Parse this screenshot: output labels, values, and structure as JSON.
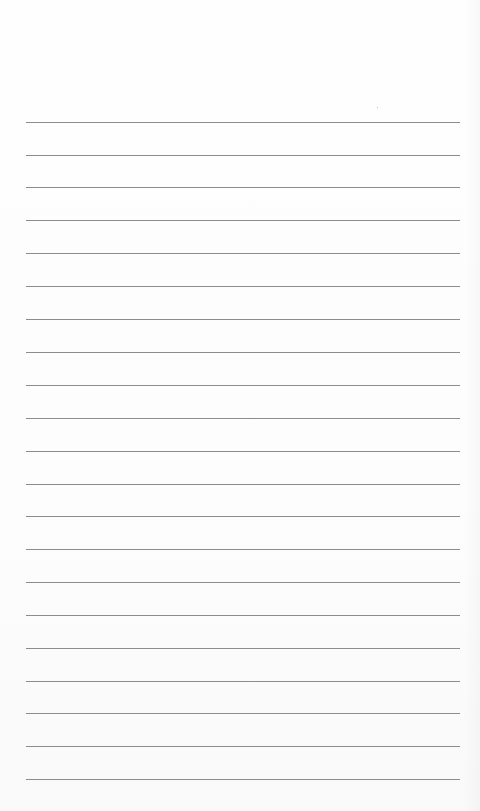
{
  "page": {
    "type": "lined-paper",
    "background_color": "#fefefe",
    "rule_color": "#8c8c8c",
    "rule_count": 21,
    "rules_y": [
      122,
      155,
      187,
      220,
      253,
      286,
      319,
      352,
      385,
      418,
      451,
      484,
      516,
      549,
      582,
      615,
      648,
      681,
      713,
      746,
      779
    ],
    "rule_left": 26,
    "rule_right": 460,
    "text": []
  }
}
